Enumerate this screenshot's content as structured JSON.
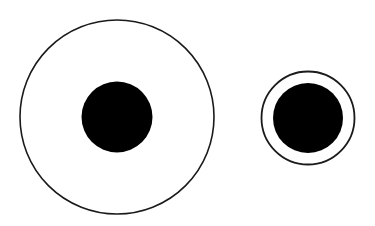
{
  "figure": {
    "name": "Delboeuf illusion",
    "background": "#ffffff",
    "stroke_color": "#1a1a1a",
    "fill_color": "#000000"
  },
  "left_figure": {
    "outer_ring": {
      "cx": 117,
      "cy": 117,
      "r": 97,
      "stroke_width": 1.6
    },
    "inner_disc": {
      "cx": 117,
      "cy": 117,
      "r": 35.5
    }
  },
  "right_figure": {
    "outer_ring": {
      "cx": 308,
      "cy": 118,
      "r": 46.5,
      "stroke_width": 1.8
    },
    "inner_disc": {
      "cx": 308,
      "cy": 118,
      "r": 35
    }
  }
}
